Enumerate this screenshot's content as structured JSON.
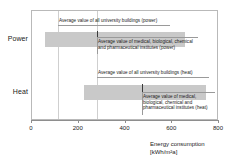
{
  "chart_data": {
    "type": "bar",
    "title": "",
    "xlabel": "Energy consumption [kWh/m²a]",
    "ylabel": "",
    "xlim": [
      0,
      800
    ],
    "xticks": [
      0,
      200,
      400,
      600,
      800
    ],
    "grid": false,
    "legend": "none",
    "categories": [
      "Power",
      "Heat"
    ],
    "series": [
      {
        "name": "Range of university buildings",
        "type": "range",
        "values": [
          {
            "category": "Power",
            "min": 58,
            "max": 630
          },
          {
            "category": "Heat",
            "min": 217,
            "max": 715
          }
        ]
      },
      {
        "name": "Average value of all university buildings",
        "type": "marker-line",
        "values": [
          {
            "category": "Power",
            "value": 110
          },
          {
            "category": "Heat",
            "value": 270
          }
        ]
      },
      {
        "name": "Average value of medical, biological, chemical and pharmaceutical institutes",
        "type": "marker-tick",
        "values": [
          {
            "category": "Power",
            "value": 270
          },
          {
            "category": "Heat",
            "value": 453
          }
        ]
      }
    ]
  },
  "axis": {
    "x_title_line1": "Energy consumption",
    "x_title_line2": "[kWh/m²a]",
    "tick_labels": [
      "0",
      "200",
      "400",
      "600",
      "800"
    ]
  },
  "categories": {
    "power_label": "Power",
    "heat_label": "Heat"
  },
  "annotations": {
    "power_university_avg": "Average value of all university buildings (power)",
    "power_institutes_avg": "Average value of medical, biological, chemical and pharmaceutical institutes (power)",
    "heat_university_avg": "Average value of all university buildings (heat)",
    "heat_institutes_avg": "Average value of medical, biological, chemical and pharmaceutical institutes (heat)"
  },
  "colors": {
    "bar_fill": "#c9c9c9",
    "institute_marker": "#3a3a3a",
    "university_avg_line": "#cfcfcf",
    "frame": "#b9b9b9",
    "axis": "#8e8e8e",
    "text": "#1a1a1a"
  }
}
